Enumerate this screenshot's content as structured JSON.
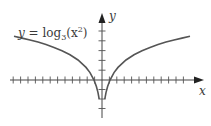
{
  "chart_data": {
    "type": "line",
    "title": "",
    "function_label": "y = log",
    "function_label_sub": "3",
    "function_label_tail": "(x",
    "function_label_sup": "2",
    "function_label_end": ")",
    "xlabel": "x",
    "ylabel": "y",
    "series": [
      {
        "name": "y = log3(x^2)",
        "x": [
          -11,
          -10,
          -9,
          -8,
          -7,
          -6,
          -5,
          -4,
          -3,
          -2,
          -1.5,
          -1,
          -0.7,
          -0.5,
          -0.35,
          0.35,
          0.5,
          0.7,
          1,
          1.5,
          2,
          3,
          4,
          5,
          6,
          7,
          8,
          9,
          10,
          11
        ],
        "y": [
          4.37,
          4.19,
          4.0,
          3.79,
          3.54,
          3.26,
          2.93,
          2.52,
          2.0,
          1.26,
          0.74,
          0.0,
          -0.65,
          -1.26,
          -1.91,
          -1.91,
          -1.26,
          -0.65,
          0.0,
          0.74,
          1.26,
          2.0,
          2.52,
          2.93,
          3.26,
          3.54,
          3.79,
          4.0,
          4.19,
          4.37
        ]
      }
    ],
    "x_ticks_count_left": 12,
    "x_ticks_count_right": 12,
    "y_ticks_above": 5,
    "y_ticks_below": 3,
    "grid": false,
    "legend": "none",
    "colors": {
      "curve": "#555555",
      "axes": "#444444",
      "text": "#3a3a3a"
    }
  }
}
